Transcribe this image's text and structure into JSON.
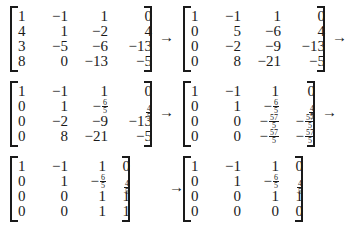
{
  "arrow": "→",
  "matrices": [
    {
      "rows": [
        [
          "1",
          "−1",
          "1",
          "0"
        ],
        [
          "4",
          "1",
          "−2",
          "4"
        ],
        [
          "3",
          "−5",
          "−6",
          "−13"
        ],
        [
          "8",
          "0",
          "−13",
          "−5"
        ]
      ]
    },
    {
      "rows": [
        [
          "1",
          "−1",
          "1",
          "0"
        ],
        [
          "0",
          "5",
          "−6",
          "4"
        ],
        [
          "0",
          "−2",
          "−9",
          "−13"
        ],
        [
          "0",
          "8",
          "−21",
          "−5"
        ]
      ]
    },
    {
      "rows": [
        [
          "1",
          "−1",
          "1",
          "0"
        ],
        [
          "0",
          "1",
          "−6/5",
          "4/5"
        ],
        [
          "0",
          "−2",
          "−9",
          "−13"
        ],
        [
          "0",
          "8",
          "−21",
          "−5"
        ]
      ]
    },
    {
      "rows": [
        [
          "1",
          "−1",
          "1",
          "0"
        ],
        [
          "0",
          "1",
          "−6/5",
          "4/5"
        ],
        [
          "0",
          "0",
          "−57/5",
          "−57/5"
        ],
        [
          "0",
          "0",
          "−57/5",
          "−57/5"
        ]
      ]
    },
    {
      "rows": [
        [
          "1",
          "−1",
          "1",
          "0"
        ],
        [
          "0",
          "1",
          "−6/5",
          "4/5"
        ],
        [
          "0",
          "0",
          "1",
          "1"
        ],
        [
          "0",
          "0",
          "1",
          "1"
        ]
      ]
    },
    {
      "rows": [
        [
          "1",
          "−1",
          "1",
          "0"
        ],
        [
          "0",
          "1",
          "−6/5",
          "4/5"
        ],
        [
          "0",
          "0",
          "1",
          "1"
        ],
        [
          "0",
          "0",
          "0",
          "0"
        ]
      ]
    }
  ]
}
